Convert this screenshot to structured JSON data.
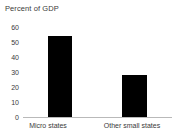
{
  "chart_data": {
    "type": "bar",
    "title": "Percent of GDP",
    "xlabel": "",
    "ylabel": "",
    "categories": [
      "Micro states",
      "Other small states"
    ],
    "values": [
      54,
      28
    ],
    "ylim": [
      0,
      60
    ],
    "yticks": [
      0,
      10,
      20,
      30,
      40,
      50,
      60
    ],
    "ytick_labels": [
      "0",
      "10",
      "20",
      "30",
      "40",
      "50",
      "60"
    ],
    "grid": false,
    "legend": false,
    "bar_color": "#000000",
    "axis_color": "#b9b9b9",
    "text_color": "#3a3a3a",
    "background": "#ffffff"
  }
}
